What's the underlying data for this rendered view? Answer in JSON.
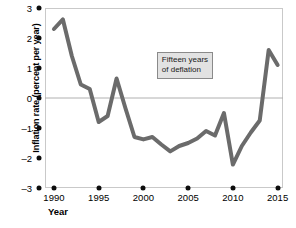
{
  "chart_data": {
    "type": "line",
    "title": "",
    "xlabel": "Year",
    "ylabel": "Inflation rate (percent per year)",
    "xlim": [
      1989,
      2015.6
    ],
    "ylim": [
      -3,
      3
    ],
    "grid": false,
    "legend": null,
    "zero_line": 0,
    "line_color": "#6b6b6b",
    "x_ticks": [
      "1990",
      "1995",
      "2000",
      "2005",
      "2010",
      "2015"
    ],
    "x_tick_values": [
      1990,
      1995,
      2000,
      2005,
      2010,
      2015
    ],
    "y_ticks": [
      "3",
      "2",
      "1",
      "0",
      "-1",
      "-2",
      "-3"
    ],
    "y_tick_values": [
      3,
      2,
      1,
      0,
      -1,
      -2,
      -3
    ],
    "x": [
      1990,
      1991,
      1992,
      1993,
      1994,
      1995,
      1996,
      1997,
      1998,
      1999,
      2000,
      2001,
      2002,
      2003,
      2004,
      2005,
      2006,
      2007,
      2008,
      2009,
      2010,
      2011,
      2012,
      2013,
      2014,
      2015
    ],
    "values": [
      2.3,
      2.62,
      1.4,
      0.45,
      0.3,
      -0.8,
      -0.6,
      0.65,
      -0.35,
      -1.3,
      -1.38,
      -1.3,
      -1.55,
      -1.78,
      -1.6,
      -1.5,
      -1.35,
      -1.1,
      -1.25,
      -0.5,
      -2.22,
      -1.6,
      -1.15,
      -0.75,
      1.6,
      1.1
    ],
    "annotations": [
      {
        "name": "deflation-callout",
        "line1": "Fifteen years",
        "line2": "of deflation",
        "x": 2001.5,
        "y": 1.55
      }
    ]
  }
}
